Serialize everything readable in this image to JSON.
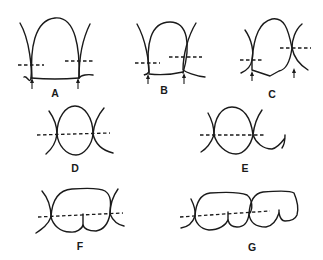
{
  "figure": {
    "panels": [
      {
        "id": "A",
        "label": "A",
        "contact_arrows": 2,
        "dashed_line": "split-level"
      },
      {
        "id": "B",
        "label": "B",
        "contact_arrows": 2,
        "dashed_line": "split-level"
      },
      {
        "id": "C",
        "label": "C",
        "contact_arrows": 2,
        "dashed_line": "split-level"
      },
      {
        "id": "D",
        "label": "D",
        "contact_arrows": 0,
        "dashed_line": "continuous"
      },
      {
        "id": "E",
        "label": "E",
        "contact_arrows": 0,
        "dashed_line": "continuous"
      },
      {
        "id": "F",
        "label": "F",
        "contact_arrows": 0,
        "dashed_line": "continuous"
      },
      {
        "id": "G",
        "label": "G",
        "contact_arrows": 0,
        "dashed_line": "continuous"
      }
    ],
    "line_color": "#1a1a1a",
    "background": "#ffffff"
  }
}
